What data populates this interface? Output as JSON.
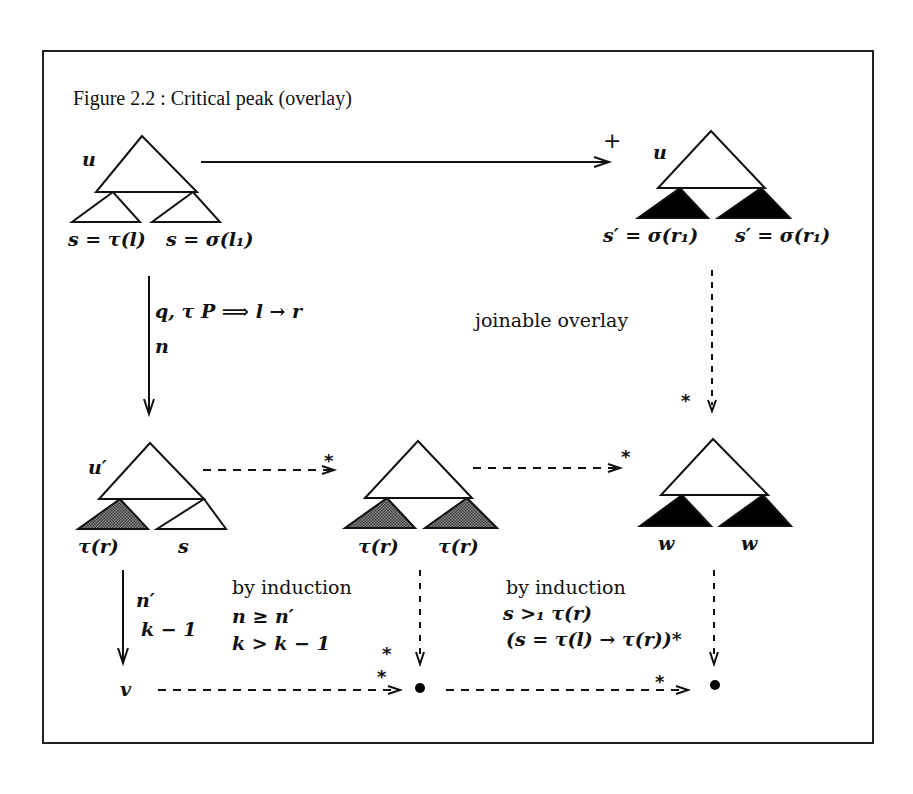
{
  "figure": {
    "title": "Figure 2.2 : Critical peak (overlay)"
  },
  "colors": {
    "stroke": "#111111",
    "filled_subtree": "#000000",
    "shaded_subtree": "#555555",
    "background": "#ffffff"
  },
  "nodes": {
    "top_left": {
      "root_label": "u",
      "left_subtree_label": "s = τ(l)",
      "right_subtree_label": "s = σ(l₁)",
      "subtree_style": "outline"
    },
    "top_right": {
      "root_label": "u",
      "left_subtree_label": "s′ = σ(r₁)",
      "right_subtree_label": "s′ = σ(r₁)",
      "subtree_style": "filled"
    },
    "mid_left": {
      "root_label": "u′",
      "left_subtree_label": "τ(r)",
      "right_subtree_label": "s",
      "left_subtree_style": "shaded",
      "right_subtree_style": "outline"
    },
    "mid_center": {
      "root_label": "",
      "left_subtree_label": "τ(r)",
      "right_subtree_label": "τ(r)",
      "subtree_style": "shaded"
    },
    "mid_right": {
      "root_label": "",
      "left_subtree_label": "w",
      "right_subtree_label": "w",
      "subtree_style": "filled"
    },
    "bottom_left": {
      "label": "v"
    },
    "bottom_center": {
      "label": "•"
    },
    "bottom_right": {
      "label": "•"
    }
  },
  "edges": {
    "top_horizontal": {
      "style": "solid",
      "annotation": "+"
    },
    "left_vertical": {
      "style": "solid",
      "annotation_line1": "q, τ P ⟹ l → r",
      "annotation_line2": "n"
    },
    "right_vertical": {
      "style": "dashed",
      "annotation": "*"
    },
    "joinable_text": "joinable overlay",
    "mid_left_to_center": {
      "style": "dashed",
      "annotation": "*"
    },
    "mid_center_to_right": {
      "style": "dashed",
      "annotation": "*"
    },
    "lower_left_vertical": {
      "style": "solid",
      "annotation_line1": "n′",
      "annotation_line2": "k − 1"
    },
    "lower_center_vertical": {
      "style": "dashed",
      "annotation": "*"
    },
    "lower_right_vertical": {
      "style": "dashed"
    },
    "bottom_left_to_center": {
      "style": "dashed",
      "annotation": "*"
    },
    "bottom_center_to_right": {
      "style": "dashed",
      "annotation": "*"
    }
  },
  "induction_left": {
    "heading": "by induction",
    "line1": "n ≥ n′",
    "line2": "k > k − 1"
  },
  "induction_right": {
    "heading": "by induction",
    "line1": "s >₁ τ(r)",
    "line2": "(s = τ(l) → τ(r))*"
  }
}
